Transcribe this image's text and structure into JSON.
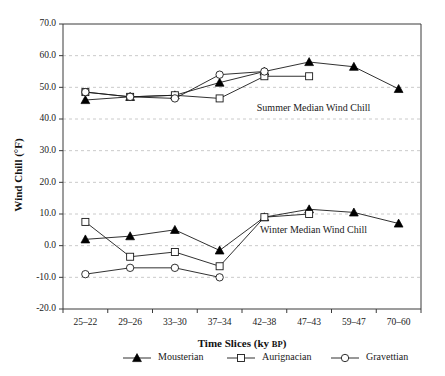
{
  "chart_data": {
    "type": "line",
    "title": "",
    "xlabel": "Time Slices (ky BP)",
    "xlabel_main": "Time Slices (ky",
    "xlabel_small": "BP",
    "xlabel_close": ")",
    "ylabel": "Wind Chill (°F)",
    "categories": [
      "25–22",
      "29–26",
      "33–30",
      "37–34",
      "42–38",
      "47–43",
      "59–47",
      "70–60"
    ],
    "ylim": [
      -20.0,
      70.0
    ],
    "ytick_labels": [
      "70.0",
      "60.0",
      "50.0",
      "40.0",
      "30.0",
      "20.0",
      "10.0",
      "0.0",
      "-10.0",
      "-20.0"
    ],
    "ytick_values": [
      70,
      60,
      50,
      40,
      30,
      20,
      10,
      0,
      -10,
      -20
    ],
    "grid": true,
    "legend_position": "bottom",
    "annotations": [
      {
        "text": "Summer Median Wind Chill",
        "x_category_index": 5.1,
        "y_value": 42.5
      },
      {
        "text": "Winter Median Wind Chill",
        "x_category_index": 5.1,
        "y_value": 4.0
      }
    ],
    "groups": [
      {
        "name": "Summer Median Wind Chill",
        "series": [
          {
            "name": "Mousterian",
            "marker": "filled-triangle",
            "values": [
              46.0,
              47.0,
              47.5,
              51.5,
              55.0,
              58.0,
              56.5,
              49.5
            ]
          },
          {
            "name": "Aurignacian",
            "marker": "open-square",
            "values": [
              48.5,
              47.0,
              47.5,
              46.5,
              53.5,
              53.5,
              null,
              null
            ]
          },
          {
            "name": "Gravettian",
            "marker": "open-circle",
            "values": [
              48.5,
              47.0,
              46.5,
              54.0,
              55.0,
              null,
              null,
              null
            ]
          }
        ]
      },
      {
        "name": "Winter Median Wind Chill",
        "series": [
          {
            "name": "Mousterian",
            "marker": "filled-triangle",
            "values": [
              2.0,
              3.0,
              5.0,
              -1.5,
              9.0,
              11.5,
              10.5,
              7.0
            ]
          },
          {
            "name": "Aurignacian",
            "marker": "open-square",
            "values": [
              7.5,
              -3.5,
              -2.0,
              -6.5,
              9.0,
              10.0,
              null,
              null
            ]
          },
          {
            "name": "Gravettian",
            "marker": "open-circle",
            "values": [
              -9.0,
              -7.0,
              -7.0,
              -10.0,
              null,
              null,
              null,
              null
            ]
          }
        ]
      }
    ],
    "legend": [
      {
        "label": "Mousterian",
        "marker": "filled-triangle"
      },
      {
        "label": "Aurignacian",
        "marker": "open-square"
      },
      {
        "label": "Gravettian",
        "marker": "open-circle"
      }
    ],
    "colors": {
      "line": "#1a1a1a",
      "grid": "#bdbdbd",
      "axis": "#3a3a3a",
      "marker_fill": "#000000",
      "marker_open_fill": "#ffffff",
      "background": "#ffffff"
    }
  }
}
